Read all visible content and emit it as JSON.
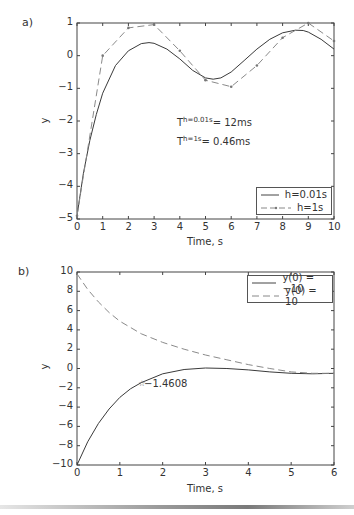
{
  "chart_data": [
    {
      "panel": "a)",
      "type": "line",
      "title": "",
      "xlabel": "Time, s",
      "ylabel": "y",
      "xlim": [
        0,
        10
      ],
      "ylim": [
        -5,
        1
      ],
      "xticks": [
        "0",
        "1",
        "2",
        "3",
        "4",
        "5",
        "6",
        "7",
        "8",
        "9",
        "10"
      ],
      "yticks": [
        "1",
        "0",
        "−1",
        "−2",
        "−3",
        "−4",
        "−5"
      ],
      "grid": false,
      "legend_position": "lower right",
      "series": [
        {
          "name": "h=0.01s",
          "style": "solid",
          "x": [
            0,
            0.25,
            0.5,
            0.75,
            1,
            1.5,
            2,
            2.5,
            2.8,
            3,
            3.5,
            4,
            4.5,
            5,
            5.3,
            5.6,
            6,
            6.5,
            7,
            7.5,
            8,
            8.5,
            8.8,
            9,
            9.5,
            10
          ],
          "y": [
            -4.9,
            -3.6,
            -2.6,
            -1.8,
            -1.15,
            -0.3,
            0.15,
            0.37,
            0.4,
            0.38,
            0.2,
            -0.1,
            -0.45,
            -0.68,
            -0.72,
            -0.68,
            -0.5,
            -0.15,
            0.2,
            0.5,
            0.7,
            0.78,
            0.77,
            0.72,
            0.5,
            0.2
          ]
        },
        {
          "name": "h=1s",
          "style": "dashed-dot-markers",
          "x": [
            0,
            1,
            2,
            3,
            4,
            5,
            6,
            7,
            8,
            9,
            10
          ],
          "y": [
            -4.9,
            0.0,
            0.85,
            0.95,
            0.15,
            -0.75,
            -0.95,
            -0.3,
            0.55,
            1.0,
            0.45
          ]
        }
      ],
      "annotations": [
        {
          "text_base": "T",
          "text_sup": "h=0.01s",
          "text_rest": "= 12ms"
        },
        {
          "text_base": "T",
          "text_sup": "h=1s",
          "text_rest": "= 0.46ms"
        }
      ]
    },
    {
      "panel": "b)",
      "type": "line",
      "title": "",
      "xlabel": "Time, s",
      "ylabel": "y",
      "xlim": [
        0,
        6
      ],
      "ylim": [
        -10,
        10
      ],
      "xticks": [
        "0",
        "1",
        "2",
        "3",
        "4",
        "5",
        "6"
      ],
      "yticks": [
        "10",
        "8",
        "6",
        "4",
        "2",
        "0",
        "−2",
        "−4",
        "−6",
        "−8",
        "−10"
      ],
      "grid": false,
      "legend_position": "upper right",
      "series": [
        {
          "name": "y(0) = −10",
          "style": "solid",
          "x": [
            0,
            0.25,
            0.5,
            0.75,
            1,
            1.25,
            1.5,
            2,
            2.5,
            3,
            3.5,
            4,
            4.5,
            5,
            5.5,
            6
          ],
          "y": [
            -10,
            -7.6,
            -5.7,
            -4.2,
            -3.0,
            -2.1,
            -1.46,
            -0.55,
            -0.1,
            0.05,
            0.0,
            -0.15,
            -0.35,
            -0.5,
            -0.55,
            -0.5
          ]
        },
        {
          "name": "y(0) = 10",
          "style": "dashed",
          "x": [
            0,
            0.25,
            0.5,
            0.75,
            1,
            1.5,
            2,
            2.5,
            3,
            3.5,
            4,
            4.5,
            5,
            5.5,
            6
          ],
          "y": [
            9.8,
            8.2,
            6.9,
            5.8,
            4.9,
            3.6,
            2.7,
            2.0,
            1.4,
            0.9,
            0.4,
            0.0,
            -0.35,
            -0.5,
            -0.5
          ]
        }
      ],
      "annotations": [
        {
          "text": "−1.4608",
          "x": 1.5,
          "y": -1.4608,
          "marker": "star"
        }
      ]
    }
  ],
  "panels": {
    "a": {
      "label": "a)",
      "ylabel": "y",
      "xlabel": "Time, s",
      "xticks": [
        "0",
        "1",
        "2",
        "3",
        "4",
        "5",
        "6",
        "7",
        "8",
        "9",
        "10"
      ],
      "yticks": [
        "1",
        "0",
        "−1",
        "−2",
        "−3",
        "−4",
        "−5"
      ],
      "annot1": {
        "base": "T",
        "sup": "h=0.01s",
        "rest": "= 12ms"
      },
      "annot2": {
        "base": "T",
        "sup": "h=1s",
        "rest": "= 0.46ms"
      },
      "legend": [
        "h=0.01s",
        "h=1s"
      ]
    },
    "b": {
      "label": "b)",
      "ylabel": "y",
      "xlabel": "Time, s",
      "xticks": [
        "0",
        "1",
        "2",
        "3",
        "4",
        "5",
        "6"
      ],
      "yticks": [
        "10",
        "8",
        "6",
        "4",
        "2",
        "0",
        "−2",
        "−4",
        "−6",
        "−8",
        "−10"
      ],
      "marker_label": "−1.4608",
      "legend": [
        "y(0) = −10",
        "y(0) = 10"
      ]
    }
  }
}
